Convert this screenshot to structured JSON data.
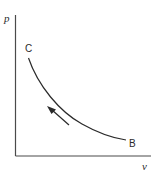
{
  "diagram": {
    "type": "pv-diagram",
    "axes": {
      "y_label": "p",
      "x_label": "v"
    },
    "points": {
      "start": {
        "label": "B"
      },
      "end": {
        "label": "C"
      }
    },
    "process": {
      "direction": "B to C",
      "arrow": "arrow-icon"
    },
    "colors": {
      "line": "#2a2a2a",
      "axis": "#4a4a4a",
      "background": "#ffffff"
    }
  }
}
